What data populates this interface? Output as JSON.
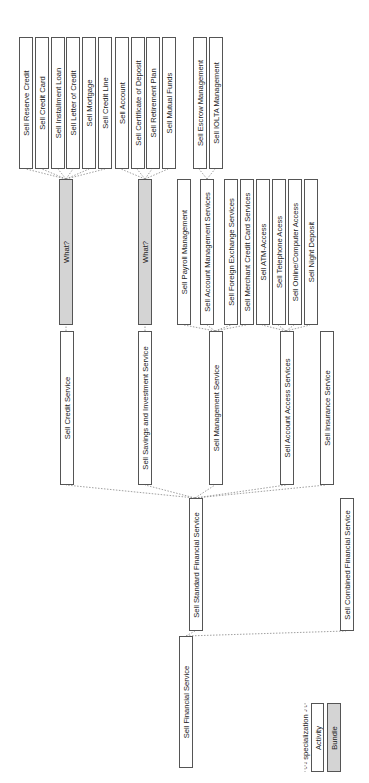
{
  "diagram": {
    "type": "specialization hierarchy",
    "colors": {
      "activity_fill": "#ffffff",
      "bundle_fill": "#d4d4d4",
      "border": "#555555",
      "edge": "#888888"
    },
    "nodes": {
      "sell_financial_service": "Sell Financial Service",
      "sell_standard_financial_service": "Sell Standard Financial Service",
      "sell_combined_financial_service": "Sell Combined Financial Service",
      "sell_credit_service": "Sell Credit Service",
      "sell_savings_investment_service": "Sell Savings and Investment Service",
      "sell_management_service": "Sell Management Service",
      "sell_account_access_services": "Sell Account Access Services",
      "sell_insurance_service": "Sell Insurance Service",
      "what_credit": "What?",
      "what_savings": "What?",
      "sell_payroll_management": "Sell Payroll Management",
      "sell_account_management_services": "Sell Account Management Services",
      "sell_foreign_exchange_services": "Sell Foreign Exchange Services",
      "sell_merchant_credit_card_services": "Sell Merchant Credit Card Services",
      "sell_atm_access": "Sell ATM-Access",
      "sell_telephone_access": "Sell Telephone Acess",
      "sell_online_computer_access": "Sell Online/Computer Access",
      "sell_night_deposit": "Sell Night Deposit",
      "sell_reserve_credit": "Sell Reserve Credit",
      "sell_credit_card": "Sell Credit Card",
      "sell_installment_loan": "Sell Installment Loan",
      "sell_letter_of_credit": "Sell Letter of Credit",
      "sell_mortgage": "Sell Mortgage",
      "sell_credit_line": "Sell Credit Line",
      "sell_account": "Sell Account",
      "sell_certificate_of_deposit": "Sell Certificate of Deposit",
      "sell_retirement_plan": "Sell Retirement Plan",
      "sell_mutual_funds": "Sell Mutual Funds",
      "sell_escrow_management": "Sell Escrow Management",
      "sell_iolta_management": "Sell IOLTA Management"
    },
    "legend": {
      "specialization": "- - specialization - -",
      "activity": "Activity",
      "bundle": "Bundle"
    }
  }
}
